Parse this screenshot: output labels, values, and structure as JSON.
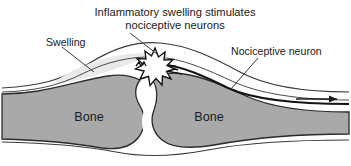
{
  "figure": {
    "type": "anatomical-diagram",
    "background_color": "#ffffff",
    "bone_fill_color": "#a9a9a9",
    "swelling_fill_color": "#e9e9e9",
    "periosteum_fill_color": "#ffffff",
    "outline_color": "#2b2b2b",
    "nerve_color": "#1a1a1a",
    "starburst_color": "#141414"
  },
  "caption": {
    "line1": "Inflammatory swelling stimulates",
    "line2": "nociceptive neurons"
  },
  "labels": {
    "swelling": "Swelling",
    "nociceptive_neuron": "Nociceptive neuron",
    "bone_left": "Bone",
    "bone_right": "Bone"
  },
  "annotations": {
    "nerve_signal_arrow": "arrow-right",
    "pain_burst": "starburst"
  }
}
